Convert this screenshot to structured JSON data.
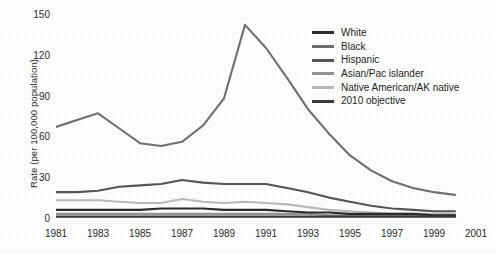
{
  "axes": {
    "ylabel": "Rate (per 100,000 population)",
    "yticks": [
      "0",
      "30",
      "60",
      "90",
      "120",
      "150"
    ],
    "xticks": [
      "1981",
      "1983",
      "1985",
      "1987",
      "1989",
      "1991",
      "1993",
      "1995",
      "1997",
      "1999",
      "2001"
    ]
  },
  "legend": {
    "items": [
      {
        "label": "White",
        "color": "#2b2b2b"
      },
      {
        "label": "Black",
        "color": "#6f6f6f"
      },
      {
        "label": "Hispanic",
        "color": "#555555"
      },
      {
        "label": "Asian/Pac islander",
        "color": "#939393"
      },
      {
        "label": "Native American/AK native",
        "color": "#b9b9b9"
      },
      {
        "label": "2010 objective",
        "color": "#3a3a3a"
      }
    ]
  },
  "chart_data": {
    "type": "line",
    "title": "",
    "xlabel": "",
    "ylabel": "Rate (per 100,000 population)",
    "xlim": [
      1981,
      2001
    ],
    "ylim": [
      0,
      150
    ],
    "ytick_values": [
      0,
      30,
      60,
      90,
      120,
      150
    ],
    "xtick_values": [
      1981,
      1983,
      1985,
      1987,
      1989,
      1991,
      1993,
      1995,
      1997,
      1999,
      2001
    ],
    "grid": false,
    "legend_position": "upper right",
    "x": [
      1981,
      1982,
      1983,
      1984,
      1985,
      1986,
      1987,
      1988,
      1989,
      1990,
      1991,
      1992,
      1993,
      1994,
      1995,
      1996,
      1997,
      1998,
      1999,
      2000
    ],
    "series": [
      {
        "name": "White",
        "color": "#2b2b2b",
        "values": [
          6,
          6,
          6,
          6,
          6,
          7,
          7,
          7,
          6,
          6,
          6,
          5,
          4,
          4,
          3,
          3,
          3,
          3,
          2,
          2
        ]
      },
      {
        "name": "Black",
        "color": "#6f6f6f",
        "values": [
          67,
          72,
          77,
          66,
          55,
          53,
          56,
          68,
          88,
          142,
          125,
          103,
          80,
          62,
          46,
          35,
          27,
          22,
          19,
          17
        ]
      },
      {
        "name": "Hispanic",
        "color": "#555555",
        "values": [
          19,
          19,
          20,
          23,
          24,
          25,
          28,
          26,
          25,
          25,
          25,
          22,
          19,
          15,
          12,
          9,
          7,
          6,
          5,
          5
        ]
      },
      {
        "name": "Asian/Pac islander",
        "color": "#939393",
        "values": [
          3,
          3,
          3,
          3,
          3,
          3,
          3,
          3,
          3,
          3,
          3,
          3,
          3,
          2,
          2,
          2,
          2,
          2,
          2,
          2
        ]
      },
      {
        "name": "Native American/AK native",
        "color": "#b9b9b9",
        "values": [
          13,
          13,
          13,
          12,
          11,
          11,
          14,
          12,
          11,
          12,
          11,
          10,
          8,
          6,
          5,
          4,
          3,
          3,
          3,
          3
        ]
      },
      {
        "name": "2010 objective",
        "color": "#3a3a3a",
        "values": [
          1,
          1,
          1,
          1,
          1,
          1,
          1,
          1,
          1,
          1,
          1,
          1,
          1,
          1,
          1,
          1,
          1,
          1,
          1,
          1
        ]
      }
    ]
  }
}
